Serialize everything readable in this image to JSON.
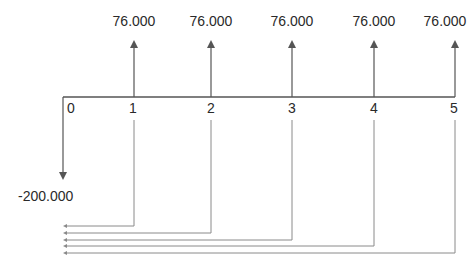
{
  "diagram": {
    "type": "cash-flow-diagram",
    "line_color": "#555555",
    "connector_color": "#8a8a8a",
    "periods": [
      {
        "label": "0",
        "x": 63
      },
      {
        "label": "1",
        "x": 134
      },
      {
        "label": "2",
        "x": 211
      },
      {
        "label": "3",
        "x": 292
      },
      {
        "label": "4",
        "x": 374
      },
      {
        "label": "5",
        "x": 455
      }
    ],
    "initial_outflow": {
      "period": "0",
      "amount_label": "-200.000",
      "direction": "down"
    },
    "inflows": [
      {
        "period": "1",
        "amount_label": "76.000",
        "direction": "up"
      },
      {
        "period": "2",
        "amount_label": "76.000",
        "direction": "up"
      },
      {
        "period": "3",
        "amount_label": "76.000",
        "direction": "up"
      },
      {
        "period": "4",
        "amount_label": "76.000",
        "direction": "up"
      },
      {
        "period": "5",
        "amount_label": "76.000",
        "direction": "up"
      }
    ],
    "discount_connectors": [
      {
        "from_period": "1",
        "y": 226
      },
      {
        "from_period": "2",
        "y": 233
      },
      {
        "from_period": "3",
        "y": 240
      },
      {
        "from_period": "4",
        "y": 246
      },
      {
        "from_period": "5",
        "y": 253
      }
    ]
  }
}
